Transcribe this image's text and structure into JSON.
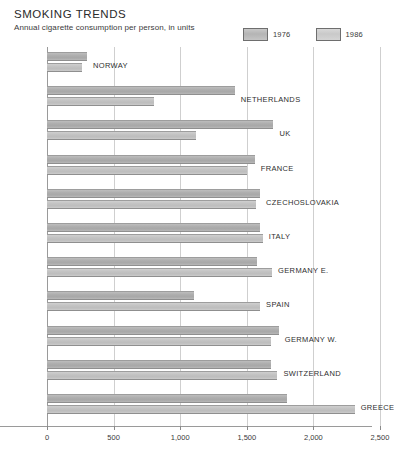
{
  "header": {
    "title": "SMOKING TRENDS",
    "subtitle": "Annual cigarette consumption per person, in units"
  },
  "legend": {
    "items": [
      {
        "label": "1976",
        "color": "#b4b4b4"
      },
      {
        "label": "1986",
        "color": "#cccccc"
      }
    ]
  },
  "chart_data": {
    "type": "bar",
    "orientation": "horizontal",
    "title": "SMOKING TRENDS",
    "subtitle": "Annual cigarette consumption per person, in units",
    "xlabel": "",
    "ylabel": "",
    "xlim": [
      0,
      2750
    ],
    "xticks": [
      0,
      500,
      1000,
      1500,
      2000,
      2500
    ],
    "xticklabels": [
      "0",
      "500",
      "1,000",
      "1,500",
      "2,000",
      "2,500"
    ],
    "grid": true,
    "legend_position": "top-right",
    "categories": [
      "NORWAY",
      "NETHERLANDS",
      "UK",
      "FRANCE",
      "CZECHOSLOVAKIA",
      "ITALY",
      "GERMANY E.",
      "SPAIN",
      "GERMANY W.",
      "SWITZERLAND",
      "GREECE"
    ],
    "series": [
      {
        "name": "1976",
        "color": "#b0b0b0",
        "values": [
          300,
          1410,
          1700,
          1560,
          1600,
          1600,
          1580,
          1100,
          1740,
          1680,
          1800
        ]
      },
      {
        "name": "1986",
        "color": "#c6c6c6",
        "values": [
          265,
          800,
          1120,
          1500,
          1570,
          1620,
          1690,
          1600,
          1680,
          1730,
          2310
        ]
      }
    ]
  }
}
